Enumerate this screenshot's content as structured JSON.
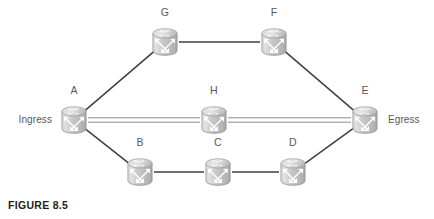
{
  "figure": {
    "caption": "FIGURE 8.5",
    "width": 434,
    "height": 219,
    "background": "#ffffff"
  },
  "colors": {
    "node_body_light": "#d9d9d9",
    "node_body_mid": "#bdbdbd",
    "node_body_dark": "#a6a6a6",
    "node_outline": "#8c8c8c",
    "node_glyph": "#ffffff",
    "link_solid": "#3f3f3f",
    "link_double": "#8c8c8c",
    "label_text": "#58595b",
    "caption_text": "#231f20"
  },
  "icons": {
    "router": "router-icon"
  },
  "nodes": [
    {
      "id": "A",
      "label": "A",
      "x": 74,
      "y": 120,
      "label_dx": 0,
      "label_dy": -27,
      "icon": "router-icon"
    },
    {
      "id": "B",
      "label": "B",
      "x": 140,
      "y": 172,
      "label_dx": 0,
      "label_dy": -27,
      "icon": "router-icon"
    },
    {
      "id": "C",
      "label": "C",
      "x": 218,
      "y": 172,
      "label_dx": 0,
      "label_dy": -27,
      "icon": "router-icon"
    },
    {
      "id": "D",
      "label": "D",
      "x": 293,
      "y": 172,
      "label_dx": 0,
      "label_dy": -27,
      "icon": "router-icon"
    },
    {
      "id": "E",
      "label": "E",
      "x": 365,
      "y": 120,
      "label_dx": 0,
      "label_dy": -27,
      "icon": "router-icon"
    },
    {
      "id": "F",
      "label": "F",
      "x": 274,
      "y": 42,
      "label_dx": 0,
      "label_dy": -27,
      "icon": "router-icon"
    },
    {
      "id": "G",
      "label": "G",
      "x": 165,
      "y": 42,
      "label_dx": 0,
      "label_dy": -27,
      "icon": "router-icon"
    },
    {
      "id": "H",
      "label": "H",
      "x": 214,
      "y": 120,
      "label_dx": 0,
      "label_dy": -27,
      "icon": "router-icon"
    }
  ],
  "links": [
    {
      "id": "A-G",
      "from": "A",
      "to": "G",
      "style": "solid"
    },
    {
      "id": "G-F",
      "from": "G",
      "to": "F",
      "style": "solid"
    },
    {
      "id": "F-E",
      "from": "F",
      "to": "E",
      "style": "solid"
    },
    {
      "id": "A-H",
      "from": "A",
      "to": "H",
      "style": "double"
    },
    {
      "id": "H-E",
      "from": "H",
      "to": "E",
      "style": "double"
    },
    {
      "id": "A-B",
      "from": "A",
      "to": "B",
      "style": "solid"
    },
    {
      "id": "B-C",
      "from": "B",
      "to": "C",
      "style": "solid"
    },
    {
      "id": "C-D",
      "from": "C",
      "to": "D",
      "style": "solid"
    },
    {
      "id": "D-E",
      "from": "D",
      "to": "E",
      "style": "solid"
    }
  ],
  "side_labels": [
    {
      "id": "ingress",
      "text": "Ingress",
      "node": "A",
      "side": "left",
      "x": 52,
      "y": 120
    },
    {
      "id": "egress",
      "text": "Egress",
      "node": "E",
      "side": "right",
      "x": 388,
      "y": 120
    }
  ]
}
